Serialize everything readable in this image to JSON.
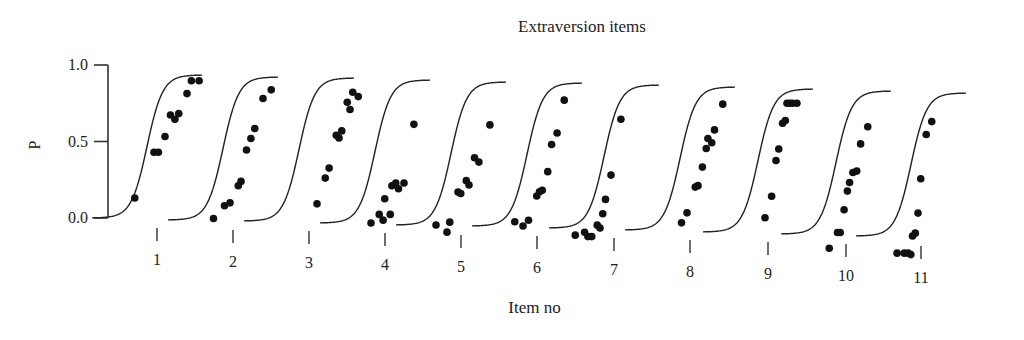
{
  "chart_data": {
    "type": "scatter",
    "title": "Extraversion items",
    "xlabel": "Item no",
    "ylabel": "P",
    "ylim": [
      0.0,
      1.0
    ],
    "yticks": [
      "0.0",
      "0.5",
      "1.0"
    ],
    "categories": [
      "1",
      "2",
      "3",
      "4",
      "5",
      "6",
      "7",
      "8",
      "9",
      "10",
      "11"
    ],
    "grid": false,
    "legend": null,
    "series": [
      {
        "name": "Item 1",
        "points": [
          [
            -0.55,
            0.14
          ],
          [
            -0.2,
            0.46
          ],
          [
            -0.12,
            0.46
          ],
          [
            0.0,
            0.57
          ],
          [
            0.1,
            0.72
          ],
          [
            0.18,
            0.69
          ],
          [
            0.25,
            0.73
          ],
          [
            0.4,
            0.87
          ],
          [
            0.48,
            0.96
          ],
          [
            0.62,
            0.96
          ]
        ]
      },
      {
        "name": "Item 2",
        "points": [
          [
            -0.5,
            0.01
          ],
          [
            -0.3,
            0.1
          ],
          [
            -0.2,
            0.12
          ],
          [
            -0.05,
            0.24
          ],
          [
            0.0,
            0.27
          ],
          [
            0.1,
            0.49
          ],
          [
            0.18,
            0.57
          ],
          [
            0.25,
            0.64
          ],
          [
            0.4,
            0.85
          ],
          [
            0.55,
            0.91
          ]
        ]
      },
      {
        "name": "Item 3",
        "points": [
          [
            0.0,
            0.12
          ],
          [
            0.15,
            0.3
          ],
          [
            0.22,
            0.37
          ],
          [
            0.35,
            0.6
          ],
          [
            0.4,
            0.58
          ],
          [
            0.45,
            0.63
          ],
          [
            0.55,
            0.83
          ],
          [
            0.6,
            0.78
          ],
          [
            0.65,
            0.9
          ],
          [
            0.75,
            0.87
          ]
        ]
      },
      {
        "name": "Item 4",
        "points": [
          [
            -0.4,
            0.0
          ],
          [
            -0.25,
            0.06
          ],
          [
            -0.18,
            0.02
          ],
          [
            -0.15,
            0.17
          ],
          [
            -0.05,
            0.06
          ],
          [
            -0.02,
            0.26
          ],
          [
            0.05,
            0.28
          ],
          [
            0.1,
            0.24
          ],
          [
            0.2,
            0.28
          ],
          [
            0.38,
            0.69
          ]
        ]
      },
      {
        "name": "Item 5",
        "points": [
          [
            -0.6,
            0.0
          ],
          [
            -0.4,
            -0.05
          ],
          [
            -0.35,
            0.02
          ],
          [
            -0.2,
            0.23
          ],
          [
            -0.15,
            0.22
          ],
          [
            -0.05,
            0.31
          ],
          [
            0.0,
            0.28
          ],
          [
            0.1,
            0.47
          ],
          [
            0.18,
            0.44
          ],
          [
            0.38,
            0.7
          ]
        ]
      },
      {
        "name": "Item 6",
        "points": [
          [
            -0.55,
            0.03
          ],
          [
            -0.4,
            0.0
          ],
          [
            -0.3,
            0.04
          ],
          [
            -0.15,
            0.21
          ],
          [
            -0.1,
            0.24
          ],
          [
            -0.05,
            0.25
          ],
          [
            0.05,
            0.38
          ],
          [
            0.12,
            0.57
          ],
          [
            0.22,
            0.65
          ],
          [
            0.35,
            0.88
          ]
        ]
      },
      {
        "name": "Item 7",
        "points": [
          [
            -0.85,
            -0.05
          ],
          [
            -0.68,
            -0.03
          ],
          [
            -0.62,
            -0.06
          ],
          [
            -0.55,
            -0.06
          ],
          [
            -0.45,
            0.02
          ],
          [
            -0.4,
            0.0
          ],
          [
            -0.35,
            0.1
          ],
          [
            -0.3,
            0.2
          ],
          [
            -0.2,
            0.37
          ],
          [
            -0.02,
            0.76
          ]
        ]
      },
      {
        "name": "Item 8",
        "points": [
          [
            -0.3,
            0.05
          ],
          [
            -0.2,
            0.12
          ],
          [
            -0.05,
            0.3
          ],
          [
            0.0,
            0.31
          ],
          [
            0.08,
            0.44
          ],
          [
            0.15,
            0.57
          ],
          [
            0.18,
            0.64
          ],
          [
            0.25,
            0.61
          ],
          [
            0.3,
            0.7
          ],
          [
            0.45,
            0.88
          ]
        ]
      },
      {
        "name": "Item 9",
        "points": [
          [
            -0.2,
            0.1
          ],
          [
            -0.08,
            0.25
          ],
          [
            0.0,
            0.5
          ],
          [
            0.05,
            0.58
          ],
          [
            0.12,
            0.76
          ],
          [
            0.17,
            0.78
          ],
          [
            0.2,
            0.9
          ],
          [
            0.25,
            0.9
          ],
          [
            0.3,
            0.9
          ],
          [
            0.38,
            0.9
          ]
        ]
      },
      {
        "name": "Item 10",
        "points": [
          [
            -0.45,
            -0.1
          ],
          [
            -0.3,
            0.01
          ],
          [
            -0.25,
            0.01
          ],
          [
            -0.18,
            0.17
          ],
          [
            -0.12,
            0.3
          ],
          [
            -0.08,
            0.36
          ],
          [
            -0.02,
            0.43
          ],
          [
            0.05,
            0.44
          ],
          [
            0.12,
            0.63
          ],
          [
            0.25,
            0.75
          ]
        ]
      },
      {
        "name": "Item 11",
        "points": [
          [
            -0.58,
            -0.12
          ],
          [
            -0.45,
            -0.12
          ],
          [
            -0.38,
            -0.12
          ],
          [
            -0.33,
            -0.13
          ],
          [
            -0.3,
            0.0
          ],
          [
            -0.25,
            0.02
          ],
          [
            -0.2,
            0.16
          ],
          [
            -0.15,
            0.4
          ],
          [
            -0.05,
            0.71
          ],
          [
            0.05,
            0.8
          ]
        ]
      }
    ]
  },
  "labels": {
    "title": "Extraversion items",
    "xlabel": "Item no",
    "ylabel": "P"
  }
}
